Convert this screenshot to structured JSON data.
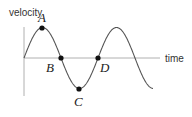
{
  "diagram": {
    "y_axis_label": "velocity",
    "x_axis_label": "time",
    "curve": "sine",
    "points": [
      {
        "name": "A",
        "description": "maximum"
      },
      {
        "name": "B",
        "description": "zero crossing"
      },
      {
        "name": "C",
        "description": "minimum"
      },
      {
        "name": "D",
        "description": "zero crossing"
      }
    ],
    "colors": {
      "axis": "#b0b0b0",
      "curve": "#555555",
      "point": "#111111"
    }
  }
}
